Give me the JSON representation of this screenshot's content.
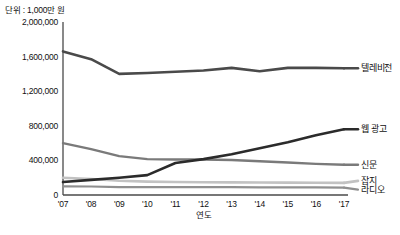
{
  "chart_data": {
    "type": "line",
    "title": "",
    "unit_note": "단위 : 1,000만 원",
    "xlabel": "연도",
    "ylabel": "",
    "x": [
      "'07",
      "'08",
      "'09",
      "'10",
      "'11",
      "'12",
      "'13",
      "'14",
      "'15",
      "'16",
      "'17"
    ],
    "ylim": [
      0,
      2000000
    ],
    "yticks": [
      "0",
      "400,000",
      "800,000",
      "1,200,000",
      "1,600,000",
      "2,000,000"
    ],
    "ytick_values": [
      0,
      400000,
      800000,
      1200000,
      1600000,
      2000000
    ],
    "grid": false,
    "legend_position": "right-inline",
    "series": [
      {
        "name": "텔레비전",
        "color": "#4a4a4a",
        "width": 2.6,
        "values": [
          1660000,
          1570000,
          1400000,
          1410000,
          1425000,
          1440000,
          1470000,
          1430000,
          1470000,
          1470000,
          1465000
        ]
      },
      {
        "name": "웹 광고",
        "color": "#2b2b2b",
        "width": 2.6,
        "values": [
          150000,
          175000,
          200000,
          230000,
          370000,
          415000,
          470000,
          540000,
          610000,
          690000,
          760000
        ]
      },
      {
        "name": "신문",
        "color": "#7a7a7a",
        "width": 2.4,
        "values": [
          600000,
          530000,
          450000,
          415000,
          410000,
          410000,
          405000,
          390000,
          375000,
          360000,
          350000
        ]
      },
      {
        "name": "잡지",
        "color": "#c2c2c2",
        "width": 2.6,
        "values": [
          200000,
          185000,
          165000,
          155000,
          150000,
          148000,
          146000,
          145000,
          143000,
          142000,
          140000
        ]
      },
      {
        "name": "라디오",
        "color": "#8f8f8f",
        "width": 2.2,
        "values": [
          100000,
          98000,
          92000,
          90000,
          90000,
          90000,
          90000,
          88000,
          88000,
          87000,
          86000
        ]
      }
    ]
  },
  "labels": {
    "television": "텔레비전",
    "web_ad": "웹 광고",
    "newspaper": "신문",
    "magazine": "잡지",
    "radio": "라디오"
  }
}
